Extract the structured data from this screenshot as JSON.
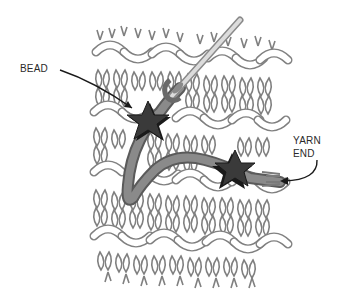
{
  "diagram": {
    "labels": {
      "bead": "BEAD",
      "yarn_end_line1": "YARN",
      "yarn_end_line2": "END"
    },
    "colors": {
      "stitch_outline": "#808080",
      "stitch_fill": "#ffffff",
      "bead": "#3a3a3a",
      "bead_shadow": "#1a1a1a",
      "yarn": "#7a7a7a",
      "needle": "#d8d8d8",
      "needle_outline": "#8a8a8a",
      "arrow": "#1a1a1a",
      "label_text": "#2a2a2a"
    },
    "elements": [
      {
        "name": "knit-fabric-swatch",
        "description": "stockinette/garter knitted fabric swatch"
      },
      {
        "name": "needle",
        "description": "tapestry needle pointing up-right"
      },
      {
        "name": "bead-1",
        "shape": "star",
        "description": "star bead on yarn near needle"
      },
      {
        "name": "bead-2",
        "shape": "star",
        "description": "star bead near yarn end"
      },
      {
        "name": "yarn-strand",
        "description": "yarn running from yarn end through beads to needle eye"
      }
    ]
  }
}
